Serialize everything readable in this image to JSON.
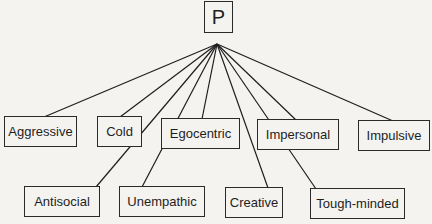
{
  "root": {
    "label": "P",
    "x": 204,
    "y": 1,
    "w": 29,
    "h": 32
  },
  "apex": {
    "x": 217,
    "y": 44
  },
  "line_color": "#1e1e1e",
  "nodes": [
    {
      "id": "aggressive",
      "label": "Aggressive",
      "x": 4,
      "y": 116,
      "w": 73,
      "h": 31,
      "anchor": [
        44,
        117
      ]
    },
    {
      "id": "cold",
      "label": "Cold",
      "x": 97,
      "y": 116,
      "w": 45,
      "h": 31,
      "anchor": [
        120,
        117
      ]
    },
    {
      "id": "egocentric",
      "label": "Egocentric",
      "x": 161,
      "y": 118,
      "w": 79,
      "h": 31,
      "anchor": [
        202,
        119
      ]
    },
    {
      "id": "impersonal",
      "label": "Impersonal",
      "x": 257,
      "y": 119,
      "w": 82,
      "h": 31,
      "anchor": [
        296,
        120
      ]
    },
    {
      "id": "impulsive",
      "label": "Impulsive",
      "x": 358,
      "y": 120,
      "w": 72,
      "h": 31,
      "anchor": [
        393,
        121
      ]
    },
    {
      "id": "antisocial",
      "label": "Antisocial",
      "x": 24,
      "y": 186,
      "w": 76,
      "h": 31,
      "anchor": [
        96,
        187
      ]
    },
    {
      "id": "unempathic",
      "label": "Unempathic",
      "x": 119,
      "y": 186,
      "w": 86,
      "h": 31,
      "anchor": [
        142,
        187
      ]
    },
    {
      "id": "creative",
      "label": "Creative",
      "x": 225,
      "y": 187,
      "w": 58,
      "h": 31,
      "anchor": [
        268,
        188
      ]
    },
    {
      "id": "tough-minded",
      "label": "Tough-minded",
      "x": 310,
      "y": 188,
      "w": 95,
      "h": 31,
      "anchor": [
        316,
        189
      ]
    }
  ]
}
